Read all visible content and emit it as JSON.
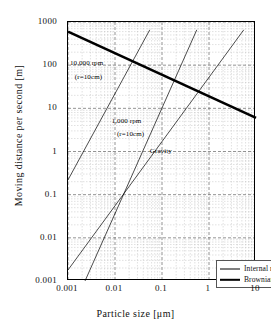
{
  "chart_data": {
    "type": "line",
    "title": "",
    "xlabel": "Particle size [μm]",
    "ylabel": "Moving distance per second [m]",
    "xscale": "log",
    "yscale": "log",
    "xlim": [
      0.001,
      10
    ],
    "ylim": [
      0.001,
      1000
    ],
    "grid": true,
    "xticks": [
      "0.001",
      "0.01",
      "0.1",
      "1",
      "10"
    ],
    "yticks": [
      "0.001",
      "0.01",
      "0.1",
      "1",
      "10",
      "100",
      "1000"
    ],
    "legend_position": "lower-right",
    "series": [
      {
        "name": "Brownian motion",
        "style": "thick",
        "color": "#000000",
        "points": [
          [
            0.001,
            600
          ],
          [
            10,
            6
          ]
        ]
      },
      {
        "name": "10,000 rpm (r=10cm)",
        "style": "thin",
        "color": "#000000",
        "group": "Internal motion",
        "points": [
          [
            0.001,
            0.22
          ],
          [
            0.055,
            660
          ]
        ]
      },
      {
        "name": "1,000 rpm (r=10cm)",
        "style": "thin",
        "color": "#000000",
        "group": "Internal motion",
        "points": [
          [
            0.0023,
            0.001
          ],
          [
            0.55,
            660
          ]
        ]
      },
      {
        "name": "Gravity",
        "style": "thin",
        "color": "#000000",
        "group": "Internal motion",
        "points": [
          [
            0.001,
            0.0018
          ],
          [
            5.5,
            660
          ]
        ]
      }
    ],
    "annotations": [
      {
        "text": "10,000 rpm",
        "x": 0.0011,
        "y": 110
      },
      {
        "text": "(r=10cm)",
        "x": 0.0014,
        "y": 52
      },
      {
        "text": "1,000 rpm",
        "x": 0.0085,
        "y": 5.2
      },
      {
        "text": "(r=10cm)",
        "x": 0.011,
        "y": 2.6
      },
      {
        "text": "Gravity",
        "x": 0.055,
        "y": 1.05
      }
    ]
  },
  "legend": {
    "items": [
      {
        "label": "Internal motion",
        "style": "thin"
      },
      {
        "label": "Brownian motion",
        "style": "thick"
      }
    ]
  },
  "axes": {
    "x_title": "Particle size [μm]",
    "y_title": "Moving distance per second [m]"
  }
}
